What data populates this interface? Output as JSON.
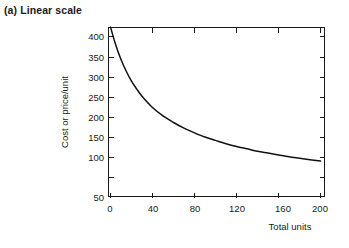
{
  "figure": {
    "panel_label": "(a) Linear scale"
  },
  "chart_data": {
    "type": "line",
    "title": "(a) Linear scale",
    "xlabel": "Total units",
    "ylabel": "Cost or price/unit",
    "xlim": [
      0,
      208
    ],
    "ylim": [
      50,
      425
    ],
    "grid": false,
    "legend": null,
    "scale": "linear",
    "xticks": [
      0,
      40,
      80,
      120,
      160,
      200
    ],
    "xticklabels": [
      "0",
      "40",
      "80",
      "120",
      "160",
      "200"
    ],
    "yticks": [
      50,
      100,
      150,
      200,
      250,
      300,
      350,
      400
    ],
    "yticklabels": [
      "50",
      "100",
      "150",
      "200",
      "250",
      "300",
      "350",
      "400"
    ],
    "series": [
      {
        "name": "experience curve",
        "x": [
          0,
          5,
          10,
          15,
          20,
          25,
          30,
          40,
          50,
          60,
          70,
          80,
          90,
          100,
          110,
          120,
          130,
          140,
          150,
          160,
          170,
          180,
          190,
          200
        ],
        "y": [
          420,
          382,
          351,
          326,
          305,
          288,
          273,
          249,
          231,
          217,
          205,
          195,
          186,
          179,
          172,
          166,
          161,
          156,
          152,
          148,
          144,
          141,
          138,
          135
        ]
      }
    ]
  },
  "axes": {
    "y_axis_title": "Cost or price/unit",
    "x_axis_title": "Total units",
    "y_tick_labels": [
      "400",
      "350",
      "300",
      "250",
      "200",
      "150",
      "100",
      "50"
    ],
    "x_tick_labels": [
      "0",
      "40",
      "80",
      "120",
      "160",
      "200"
    ]
  }
}
